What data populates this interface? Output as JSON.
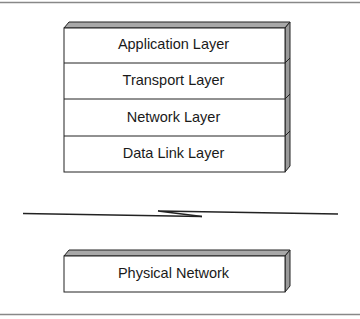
{
  "diagram": {
    "stack_layers": [
      {
        "label": "Application Layer"
      },
      {
        "label": "Transport Layer"
      },
      {
        "label": "Network Layer"
      },
      {
        "label": "Data Link Layer"
      }
    ],
    "link_symbol": "broken-line",
    "physical": {
      "label": "Physical Network"
    },
    "colors": {
      "outline": "#222222",
      "side_face": "#9a9a9a",
      "top_face": "#a8a8a8",
      "rule": "#888888"
    }
  }
}
